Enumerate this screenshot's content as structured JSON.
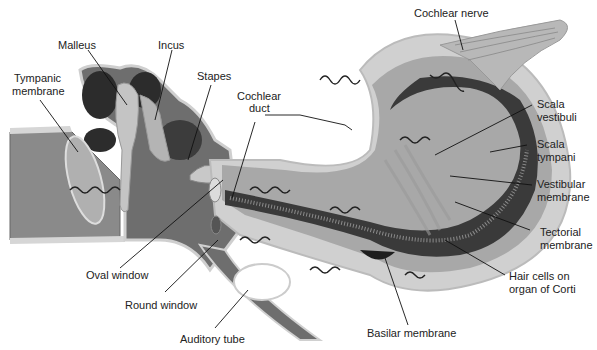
{
  "labels": {
    "malleus": "Malleus",
    "incus": "Incus",
    "tympanic_membrane_1": "Tympanic",
    "tympanic_membrane_2": "membrane",
    "stapes": "Stapes",
    "cochlear_duct_1": "Cochlear",
    "cochlear_duct_2": "duct",
    "cochlear_nerve": "Cochlear nerve",
    "scala_vestibuli_1": "Scala",
    "scala_vestibuli_2": "vestibuli",
    "scala_tympani_1": "Scala",
    "scala_tympani_2": "tympani",
    "vestibular_membrane_1": "Vestibular",
    "vestibular_membrane_2": "membrane",
    "tectorial_membrane_1": "Tectorial",
    "tectorial_membrane_2": "membrane",
    "hair_cells_1": "Hair cells on",
    "hair_cells_2": "organ of Corti",
    "basilar_membrane": "Basilar membrane",
    "oval_window": "Oval window",
    "round_window": "Round window",
    "auditory_tube": "Auditory tube"
  },
  "colors": {
    "dark_fill": "#3a3a3a",
    "mid_fill": "#7a7a7a",
    "light_fill": "#b8b8b8",
    "pale_fill": "#d6d6d6",
    "outline": "#555555",
    "leader": "#111111"
  }
}
